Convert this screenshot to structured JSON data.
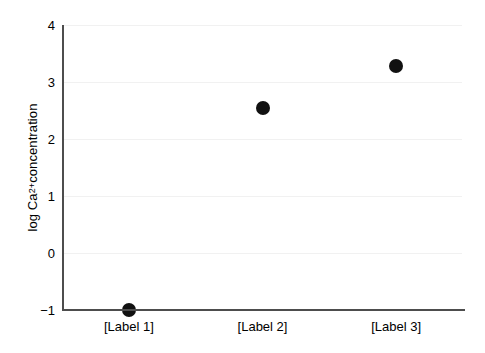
{
  "chart_data": {
    "type": "scatter",
    "title": "",
    "xlabel": "",
    "ylabel": "log Ca2+ concentration",
    "ylabel_parts": {
      "prefix": "log Ca",
      "superscript": "2+",
      "suffix": " concentration"
    },
    "categories": [
      "[Label 1]",
      "[Label 2]",
      "[Label 3]"
    ],
    "values": [
      -1.0,
      2.55,
      3.28
    ],
    "series": [
      {
        "name": "series-1",
        "values": [
          -1.0,
          2.55,
          3.28
        ]
      }
    ],
    "points": [
      {
        "category": "[Label 1]",
        "value": -1.0
      },
      {
        "category": "[Label 2]",
        "value": 2.55
      },
      {
        "category": "[Label 3]",
        "value": 3.28
      }
    ],
    "ylim": [
      -1,
      4
    ],
    "yticks": [
      -1,
      0,
      1,
      2,
      3,
      4
    ],
    "ytick_labels": [
      "−1",
      "0",
      "1",
      "2",
      "3",
      "4"
    ],
    "grid": true,
    "grid_axis": "y",
    "legend": false,
    "legend_position": "none",
    "marker": "circle",
    "marker_color": "#111111",
    "grid_color": "#f1f1f1",
    "axis_color": "#4d4d4d",
    "background_color": "#ffffff"
  }
}
